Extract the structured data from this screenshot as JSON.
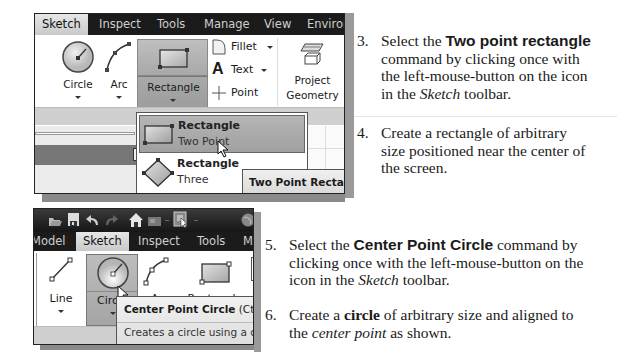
{
  "screenshot1": {
    "tabs": [
      "Sketch",
      "Inspect",
      "Tools",
      "Manage",
      "View",
      "Environ"
    ],
    "active_tab": "Sketch",
    "ribbon": {
      "circle_label": "Circle",
      "arc_label": "Arc",
      "rectangle_label": "Rectangle",
      "fillet_label": "Fillet",
      "text_label": "Text",
      "point_label": "Point",
      "project_geometry_line1": "Project",
      "project_geometry_line2": "Geometry"
    },
    "panel": {
      "close_glyph": "×",
      "help_glyph": "?"
    },
    "dropdown": {
      "items": [
        {
          "title": "Rectangle",
          "subtitle": "Two Point",
          "highlighted": true
        },
        {
          "title": "Rectangle",
          "subtitle": "Three",
          "highlighted": false
        }
      ]
    },
    "tooltip": "Two Point Rectangle"
  },
  "screenshot2": {
    "quick_access_icons": [
      "open-icon",
      "save-icon",
      "undo-icon",
      "redo-icon",
      "home-icon",
      "appearance-icon",
      "select-icon",
      "globe-icon"
    ],
    "tabs": [
      "Model",
      "Sketch",
      "Inspect",
      "Tools",
      "Ma"
    ],
    "active_tab": "Sketch",
    "ribbon": {
      "line_label": "Line",
      "circle_label": "Circ",
      "arc_label": "Arc",
      "rectangle_label": "Rectangle"
    },
    "tooltip": {
      "title": "Center Point Circle",
      "shortcut": "(Ctrl+",
      "description": "Creates a circle using a ce"
    }
  },
  "instructions": {
    "step3": {
      "number": "3.",
      "pre": "Select the ",
      "bold": "Two point rectangle",
      "line2": "command by clicking once with",
      "line3": "the left-mouse-button on the icon",
      "line4_pre": "in the ",
      "line4_italic": "Sketch",
      "line4_post": " toolbar."
    },
    "step4": {
      "number": "4.",
      "line1": "Create a rectangle of arbitrary",
      "line2": "size positioned near the center of",
      "line3": "the screen."
    },
    "step5": {
      "number": "5.",
      "pre": "Select the ",
      "bold": "Center Point Circle",
      "post": " command by",
      "line2": "clicking once with the left-mouse-button on the",
      "line3_pre": "icon in the ",
      "line3_italic": "Sketch",
      "line3_post": " toolbar."
    },
    "step6": {
      "number": "6.",
      "pre": "Create a ",
      "bold": "circle",
      "post": " of arbitrary size and aligned to",
      "line2_pre": "the ",
      "line2_italic": "center point",
      "line2_post": " as shown."
    }
  }
}
